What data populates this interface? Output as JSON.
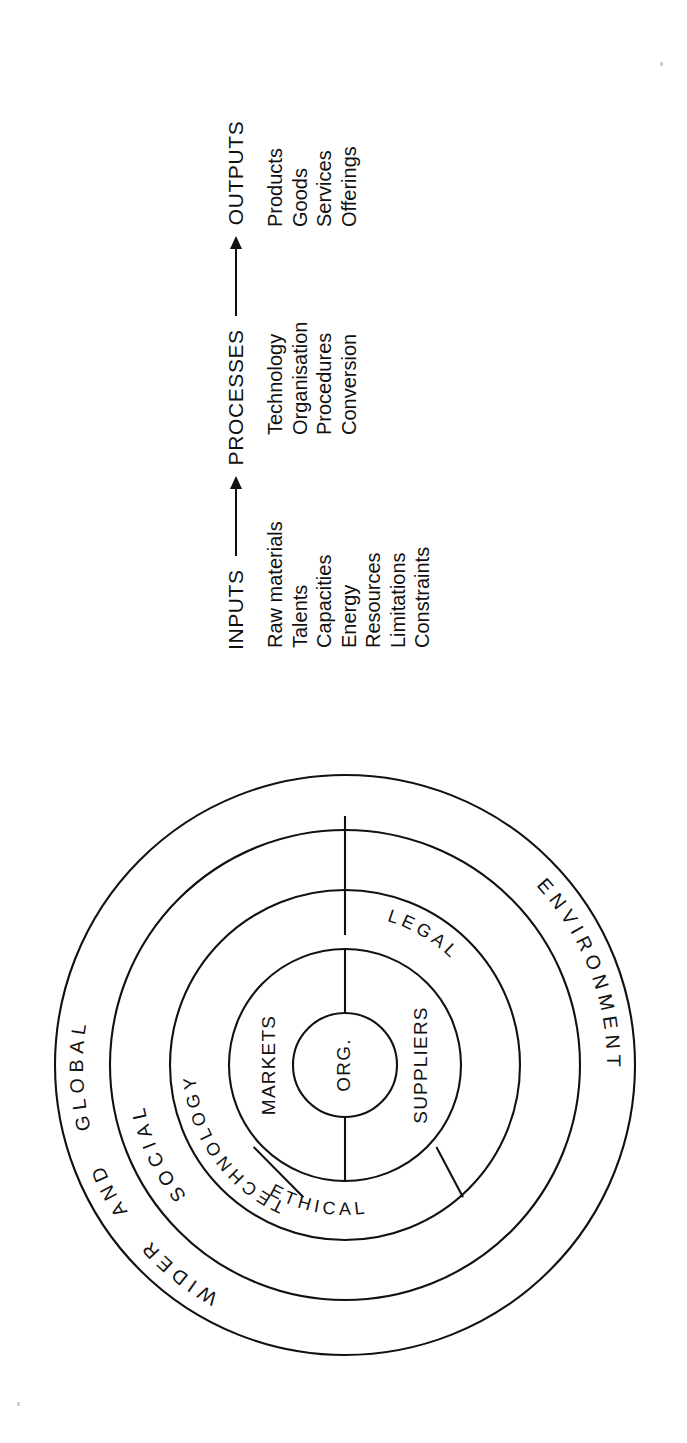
{
  "figure": {
    "background_color": "#ffffff",
    "line_color": "#111111",
    "orientation": "rotated-90-counterclockwise"
  },
  "flow": {
    "stages": [
      {
        "heading": "INPUTS",
        "items": [
          "Raw materials",
          "Talents",
          "Capacities",
          "Energy",
          "Resources",
          "Limitations",
          "Constraints"
        ]
      },
      {
        "heading": "PROCESSES",
        "items": [
          "Technology",
          "Organisation",
          "Procedures",
          "Conversion"
        ]
      },
      {
        "heading": "OUTPUTS",
        "items": [
          "Products",
          "Goods",
          "Services",
          "Offerings"
        ]
      }
    ],
    "connector_1": "arrow-right",
    "connector_2": "arrow-right"
  },
  "diagram": {
    "center_label": "ORG.",
    "ring_2": {
      "left_label": "MARKETS",
      "right_label": "SUPPLIERS"
    },
    "ring_3": {
      "labels": [
        "TECHNOLOGY",
        "ETHICAL",
        "LEGAL"
      ]
    },
    "ring_4": {
      "labels": [
        "SOCIAL"
      ]
    },
    "ring_5": {
      "labels": [
        "WIDER",
        "AND",
        "GLOBAL",
        "ENVIRONMENT"
      ]
    }
  }
}
